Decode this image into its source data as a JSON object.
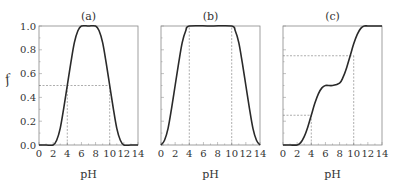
{
  "chart_data": [
    {
      "type": "line",
      "title": "(a)",
      "xlabel": "pH",
      "ylabel": "f",
      "xlim": [
        0,
        14
      ],
      "ylim": [
        0,
        1.0
      ],
      "xticks": [
        "0",
        "2",
        "4",
        "6",
        "8",
        "10",
        "12",
        "14"
      ],
      "yticks": [
        "0.0",
        "0.2",
        "0.4",
        "0.6",
        "0.8",
        "1.0"
      ],
      "grid": false,
      "series": [
        {
          "name": "f",
          "x": [
            0,
            1,
            2,
            2.5,
            3,
            3.5,
            4,
            4.5,
            5,
            5.5,
            6,
            7,
            8,
            8.5,
            9,
            9.5,
            10,
            10.5,
            11,
            11.5,
            12,
            13,
            14
          ],
          "y": [
            0,
            0,
            0,
            0.04,
            0.14,
            0.31,
            0.5,
            0.69,
            0.86,
            0.96,
            1.0,
            1.0,
            1.0,
            0.96,
            0.86,
            0.69,
            0.5,
            0.31,
            0.14,
            0.04,
            0,
            0,
            0
          ]
        }
      ],
      "annotations": [
        {
          "type": "hline",
          "y": 0.5,
          "x_range": [
            0,
            10
          ],
          "style": "dashed"
        },
        {
          "type": "vline",
          "x": 4,
          "y_range": [
            0,
            0.5
          ],
          "style": "dashed"
        },
        {
          "type": "vline",
          "x": 10,
          "y_range": [
            0,
            0.5
          ],
          "style": "dashed"
        }
      ]
    },
    {
      "type": "line",
      "title": "(b)",
      "xlabel": "pH",
      "ylabel": "",
      "xlim": [
        0,
        14
      ],
      "ylim": [
        0,
        1.0
      ],
      "xticks": [
        "0",
        "2",
        "4",
        "6",
        "8",
        "10",
        "12",
        "14"
      ],
      "yticks": [],
      "grid": false,
      "series": [
        {
          "name": "f",
          "x": [
            0,
            0.5,
            1,
            1.5,
            2,
            2.5,
            3,
            3.5,
            4,
            7,
            10,
            10.5,
            11,
            11.5,
            12,
            12.5,
            13,
            13.5,
            14
          ],
          "y": [
            0,
            0.04,
            0.14,
            0.31,
            0.5,
            0.69,
            0.86,
            0.96,
            1.0,
            1.0,
            1.0,
            0.96,
            0.86,
            0.69,
            0.5,
            0.31,
            0.14,
            0.04,
            0
          ]
        }
      ],
      "annotations": [
        {
          "type": "vline",
          "x": 4,
          "y_range": [
            0,
            1.0
          ],
          "style": "dashed"
        },
        {
          "type": "vline",
          "x": 10,
          "y_range": [
            0,
            1.0
          ],
          "style": "dashed"
        }
      ]
    },
    {
      "type": "line",
      "title": "(c)",
      "xlabel": "pH",
      "ylabel": "",
      "xlim": [
        0,
        14
      ],
      "ylim": [
        0,
        1.0
      ],
      "xticks": [
        "0",
        "2",
        "4",
        "6",
        "8",
        "10",
        "12",
        "14"
      ],
      "yticks": [],
      "grid": false,
      "series": [
        {
          "name": "f",
          "x": [
            0,
            1,
            2,
            2.5,
            3,
            3.5,
            4,
            4.5,
            5,
            5.5,
            6,
            7,
            8,
            8.5,
            9,
            9.5,
            10,
            10.5,
            11,
            11.5,
            12,
            13,
            14
          ],
          "y": [
            0,
            0,
            0,
            0.02,
            0.07,
            0.15,
            0.25,
            0.35,
            0.43,
            0.48,
            0.5,
            0.5,
            0.52,
            0.57,
            0.65,
            0.75,
            0.85,
            0.93,
            0.98,
            1.0,
            1.0,
            1.0,
            1.0
          ]
        }
      ],
      "annotations": [
        {
          "type": "hline",
          "y": 0.25,
          "x_range": [
            0,
            4
          ],
          "style": "dashed"
        },
        {
          "type": "vline",
          "x": 4,
          "y_range": [
            0,
            0.25
          ],
          "style": "dashed"
        },
        {
          "type": "hline",
          "y": 0.75,
          "x_range": [
            0,
            10
          ],
          "style": "dashed"
        },
        {
          "type": "vline",
          "x": 10,
          "y_range": [
            0,
            0.75
          ],
          "style": "dashed"
        }
      ]
    }
  ]
}
